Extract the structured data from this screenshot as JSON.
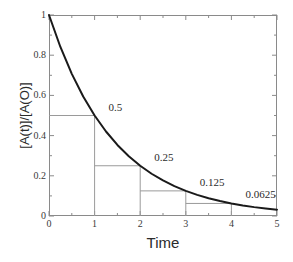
{
  "chart_data": {
    "type": "line",
    "title": "",
    "xlabel": "Time",
    "ylabel": "[A(t)]/[A(O)]",
    "xlim": [
      0,
      5
    ],
    "ylim": [
      0,
      1
    ],
    "grid": false,
    "legend": "none",
    "x_ticks": [
      "0",
      "1",
      "2",
      "3",
      "4",
      "5"
    ],
    "x_tick_values": [
      0,
      1,
      2,
      3,
      4,
      5
    ],
    "x_minor_tick_values": [
      0.5,
      1.5,
      2.5,
      3.5,
      4.5
    ],
    "y_ticks": [
      "0",
      "0.2",
      "0.4",
      "0.6",
      "0.8",
      "1"
    ],
    "y_tick_values": [
      0,
      0.2,
      0.4,
      0.6,
      0.8,
      1
    ],
    "y_minor_tick_values": [
      0.1,
      0.3,
      0.5,
      0.7,
      0.9
    ],
    "series": [
      {
        "name": "exponential decay",
        "formula": "y = 0.5^x",
        "color": "#1a1a1a",
        "x": [
          0,
          0.25,
          0.5,
          0.75,
          1,
          1.25,
          1.5,
          1.75,
          2,
          2.25,
          2.5,
          2.75,
          3,
          3.25,
          3.5,
          3.75,
          4,
          4.25,
          4.5,
          4.75,
          5
        ],
        "y": [
          1,
          0.8409,
          0.7071,
          0.5946,
          0.5,
          0.4204,
          0.3536,
          0.2973,
          0.25,
          0.2102,
          0.1768,
          0.1487,
          0.125,
          0.1051,
          0.0884,
          0.0743,
          0.0625,
          0.0526,
          0.0442,
          0.0372,
          0.03125
        ]
      }
    ],
    "annotations": [
      {
        "label": "0.5",
        "x": 1,
        "y": 0.5,
        "offset_x": 14,
        "offset_y": -14
      },
      {
        "label": "0.25",
        "x": 2,
        "y": 0.25,
        "offset_x": 14,
        "offset_y": -14
      },
      {
        "label": "0.125",
        "x": 3,
        "y": 0.125,
        "offset_x": 14,
        "offset_y": -14
      },
      {
        "label": "0.0625",
        "x": 4,
        "y": 0.0625,
        "offset_x": 14,
        "offset_y": -14
      }
    ],
    "guide_lines": [
      {
        "label": "half-life-1",
        "x": 1,
        "y": 0.5
      },
      {
        "label": "half-life-2",
        "x": 2,
        "y": 0.25
      },
      {
        "label": "half-life-3",
        "x": 3,
        "y": 0.125
      },
      {
        "label": "half-life-4",
        "x": 4,
        "y": 0.0625
      }
    ],
    "colors": {
      "curve": "#1a1a1a",
      "frame": "#8a8a8a",
      "guide": "#9a9a9a",
      "text": "#2b2b2b",
      "background": "#ffffff"
    }
  }
}
